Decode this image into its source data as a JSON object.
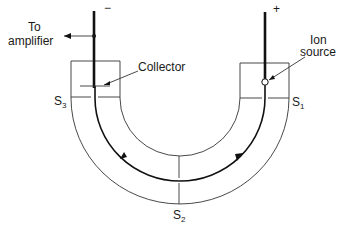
{
  "diagram": {
    "labels": {
      "amplifier_line1": "To",
      "amplifier_line2": "amplifier",
      "collector": "Collector",
      "ion_source_line1": "Ion",
      "ion_source_line2": "source",
      "negative": "−",
      "positive": "+",
      "s1": "S",
      "s1_sub": "1",
      "s2": "S",
      "s2_sub": "2",
      "s3": "S",
      "s3_sub": "3"
    },
    "colors": {
      "line": "#333333",
      "text": "#1a1a1a",
      "background": "#ffffff"
    }
  }
}
